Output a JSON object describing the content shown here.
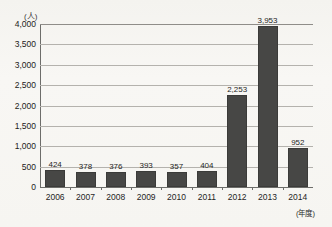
{
  "chart_data": {
    "type": "bar",
    "title": "",
    "xlabel": "(年度)",
    "ylabel": "(人)",
    "categories": [
      "2006",
      "2007",
      "2008",
      "2009",
      "2010",
      "2011",
      "2012",
      "2013",
      "2014"
    ],
    "values": [
      424,
      378,
      376,
      393,
      357,
      404,
      2253,
      3953,
      952
    ],
    "value_labels": [
      "424",
      "378",
      "376",
      "393",
      "357",
      "404",
      "2,253",
      "3,953",
      "952"
    ],
    "ylim": [
      0,
      4000
    ],
    "ytick_values": [
      0,
      500,
      1000,
      1500,
      2000,
      2500,
      3000,
      3500,
      4000
    ],
    "ytick_labels": [
      "0",
      "500",
      "1,000",
      "1,500",
      "2,000",
      "2,500",
      "3,000",
      "3,500",
      "4,000"
    ],
    "grid": true,
    "legend": "none",
    "series": [
      {
        "name": "人数",
        "values": [
          424,
          378,
          376,
          393,
          357,
          404,
          2253,
          3953,
          952
        ]
      }
    ],
    "colors": {
      "bar": "#474745",
      "background": "#f7f6f3",
      "gridline": "#b4b2ad",
      "axis": "#6d6d6a",
      "text": "#1f1f1e"
    }
  }
}
